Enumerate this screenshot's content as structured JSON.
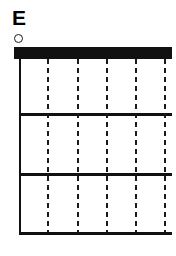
{
  "figure": {
    "panel_label": "E",
    "background_color": "#ffffff",
    "ink_color": "#111111"
  },
  "legend": {
    "marker_shape": "open-circle",
    "marker_color": "#1a1a1a",
    "marker_fill": "none"
  },
  "chart_data": {
    "type": "bar",
    "title": "E",
    "xlabel": "",
    "ylabel": "",
    "categories": [],
    "values": [],
    "grid": true,
    "legend_position": "top-left",
    "axes": {
      "left_axis_visible": true,
      "bottom_axis_visible": true,
      "right_axis_visible": false,
      "top_axis_visible": false
    },
    "elements": {
      "header_bar": {
        "style": "solid-filled",
        "color": "#111111",
        "orientation": "horizontal",
        "position": "top"
      },
      "horizontal_separators": [
        {
          "id": "separator-1",
          "style": "solid",
          "color": "#111111"
        },
        {
          "id": "separator-2",
          "style": "solid",
          "color": "#111111"
        }
      ],
      "vertical_gridlines": [
        {
          "id": "gridline-1",
          "style": "dashed",
          "color": "#1a1a1a"
        },
        {
          "id": "gridline-2",
          "style": "dashed",
          "color": "#1a1a1a"
        },
        {
          "id": "gridline-3",
          "style": "dashed",
          "color": "#1a1a1a"
        },
        {
          "id": "gridline-4",
          "style": "dashed",
          "color": "#1a1a1a"
        },
        {
          "id": "gridline-5",
          "style": "dashed",
          "color": "#1a1a1a"
        }
      ],
      "row_count": 3,
      "gridline_count": 5
    }
  }
}
